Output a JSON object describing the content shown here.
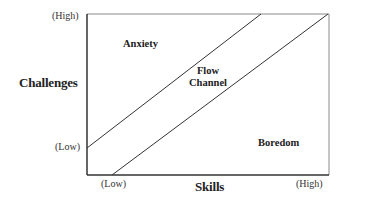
{
  "diagram": {
    "y_axis": {
      "title": "Challenges",
      "high_label": "(High)",
      "low_label": "(Low)"
    },
    "x_axis": {
      "title": "Skills",
      "low_label": "(Low)",
      "high_label": "(High)"
    },
    "regions": {
      "anxiety": "Anxiety",
      "flow_line1": "Flow",
      "flow_line2": "Channel",
      "boredom": "Boredom"
    },
    "colors": {
      "line": "#333333",
      "text": "#222222",
      "frame": "#888888"
    }
  }
}
